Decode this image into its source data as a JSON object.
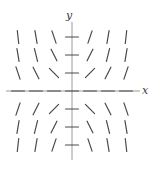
{
  "chart_data": {
    "type": "scatter",
    "subtype": "slope-field",
    "title": "",
    "xlabel": "x",
    "ylabel": "y",
    "xlim": [
      -3,
      3
    ],
    "ylim": [
      -3,
      3
    ],
    "grid": false,
    "legend": null,
    "equation": "dy/dx = x*y",
    "grid_x": [
      -3,
      -2,
      -1,
      0,
      1,
      2,
      3
    ],
    "grid_y": [
      -3,
      -2,
      -1,
      0,
      1,
      2,
      3
    ],
    "segment_length": 13,
    "segments": [
      {
        "x": -3,
        "y": 3,
        "slope": -9
      },
      {
        "x": -2,
        "y": 3,
        "slope": -6
      },
      {
        "x": -1,
        "y": 3,
        "slope": -3
      },
      {
        "x": 0,
        "y": 3,
        "slope": 0
      },
      {
        "x": 1,
        "y": 3,
        "slope": 3
      },
      {
        "x": 2,
        "y": 3,
        "slope": 6
      },
      {
        "x": 3,
        "y": 3,
        "slope": 9
      },
      {
        "x": -3,
        "y": 2,
        "slope": -6
      },
      {
        "x": -2,
        "y": 2,
        "slope": -4
      },
      {
        "x": -1,
        "y": 2,
        "slope": -2
      },
      {
        "x": 0,
        "y": 2,
        "slope": 0
      },
      {
        "x": 1,
        "y": 2,
        "slope": 2
      },
      {
        "x": 2,
        "y": 2,
        "slope": 4
      },
      {
        "x": 3,
        "y": 2,
        "slope": 6
      },
      {
        "x": -3,
        "y": 1,
        "slope": -3
      },
      {
        "x": -2,
        "y": 1,
        "slope": -2
      },
      {
        "x": -1,
        "y": 1,
        "slope": -1
      },
      {
        "x": 0,
        "y": 1,
        "slope": 0
      },
      {
        "x": 1,
        "y": 1,
        "slope": 1
      },
      {
        "x": 2,
        "y": 1,
        "slope": 2
      },
      {
        "x": 3,
        "y": 1,
        "slope": 3
      },
      {
        "x": -3,
        "y": 0,
        "slope": 0
      },
      {
        "x": -2,
        "y": 0,
        "slope": 0
      },
      {
        "x": -1,
        "y": 0,
        "slope": 0
      },
      {
        "x": 0,
        "y": 0,
        "slope": 0
      },
      {
        "x": 1,
        "y": 0,
        "slope": 0
      },
      {
        "x": 2,
        "y": 0,
        "slope": 0
      },
      {
        "x": 3,
        "y": 0,
        "slope": 0
      },
      {
        "x": -3,
        "y": -1,
        "slope": 3
      },
      {
        "x": -2,
        "y": -1,
        "slope": 2
      },
      {
        "x": -1,
        "y": -1,
        "slope": 1
      },
      {
        "x": 0,
        "y": -1,
        "slope": 0
      },
      {
        "x": 1,
        "y": -1,
        "slope": -1
      },
      {
        "x": 2,
        "y": -1,
        "slope": -2
      },
      {
        "x": 3,
        "y": -1,
        "slope": -3
      },
      {
        "x": -3,
        "y": -2,
        "slope": 6
      },
      {
        "x": -2,
        "y": -2,
        "slope": 4
      },
      {
        "x": -1,
        "y": -2,
        "slope": 2
      },
      {
        "x": 0,
        "y": -2,
        "slope": 0
      },
      {
        "x": 1,
        "y": -2,
        "slope": -2
      },
      {
        "x": 2,
        "y": -2,
        "slope": -4
      },
      {
        "x": 3,
        "y": -2,
        "slope": -6
      },
      {
        "x": -3,
        "y": -3,
        "slope": 9
      },
      {
        "x": -2,
        "y": -3,
        "slope": 6
      },
      {
        "x": -1,
        "y": -3,
        "slope": 3
      },
      {
        "x": 0,
        "y": -3,
        "slope": 0
      },
      {
        "x": 1,
        "y": -3,
        "slope": -3
      },
      {
        "x": 2,
        "y": -3,
        "slope": -6
      },
      {
        "x": 3,
        "y": -3,
        "slope": -9
      }
    ],
    "colors": {
      "background": "#ffffff",
      "segment": "#4a4a4a",
      "axis": "#9a9a9a",
      "label": "#3a3a3a"
    },
    "axes": {
      "x_axis_visible": true,
      "y_axis_visible": true,
      "ticks_visible": false,
      "tick_labels": []
    }
  },
  "labels": {
    "x": "x",
    "y": "y"
  }
}
